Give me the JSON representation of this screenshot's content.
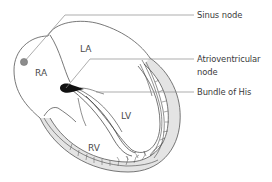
{
  "diagram": {
    "chambers": {
      "ra": "RA",
      "la": "LA",
      "lv": "LV",
      "rv": "RV"
    },
    "callouts": {
      "sinus_node": "Sinus node",
      "av_node_line1": "Atrioventricular",
      "av_node_line2": "node",
      "bundle_of_his": "Bundle of His"
    },
    "colors": {
      "outline": "#555555",
      "leader_line": "#8a8a8a",
      "sinus_node_dot": "#8c8c8c",
      "av_node": "#111111",
      "wall_fill": "#e4e4e4",
      "text": "#3a3a3a"
    }
  }
}
